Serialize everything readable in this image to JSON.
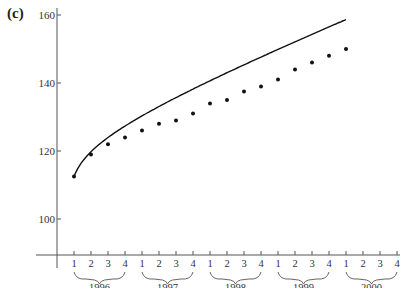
{
  "panel_label": "(c)",
  "chart_data": {
    "type": "scatter",
    "title": "",
    "xlabel": "",
    "ylabel": "",
    "ylim": [
      90,
      165
    ],
    "yticks": [
      100,
      120,
      140,
      160
    ],
    "grid": false,
    "legend": null,
    "x_quarter_labels": [
      "1",
      "2",
      "3",
      "4",
      "1",
      "2",
      "3",
      "4",
      "1",
      "2",
      "3",
      "4",
      "1",
      "2",
      "3",
      "4",
      "1",
      "2",
      "3",
      "4"
    ],
    "year_groups": [
      "1996",
      "1997",
      "1998",
      "1999",
      "2000"
    ],
    "categories": [
      "1996 Q1",
      "1996 Q2",
      "1996 Q3",
      "1996 Q4",
      "1997 Q1",
      "1997 Q2",
      "1997 Q3",
      "1997 Q4",
      "1998 Q1",
      "1998 Q2",
      "1998 Q3",
      "1998 Q4",
      "1999 Q1",
      "1999 Q2",
      "1999 Q3",
      "1999 Q4",
      "2000 Q1"
    ],
    "series": [
      {
        "name": "observed",
        "marker": "dot",
        "values": [
          112.5,
          119,
          122,
          124,
          126,
          128,
          129,
          131,
          134,
          135,
          137.5,
          139,
          141,
          144,
          146,
          148,
          150
        ]
      },
      {
        "name": "fitted curve",
        "marker": "line",
        "values": [
          112.5,
          119,
          121.8,
          123.9,
          125.9,
          127.8,
          129.7,
          131.6,
          133.5,
          135.4,
          137.3,
          139.2,
          141.1,
          143,
          144.9,
          146.8,
          148.7
        ]
      }
    ],
    "axis_color": "#555555",
    "data_color": "#111111"
  }
}
